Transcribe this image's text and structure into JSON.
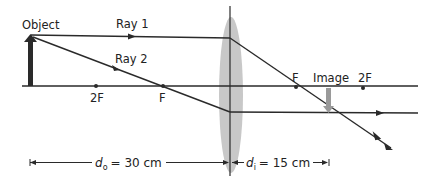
{
  "diagram": {
    "labels": {
      "object": "Object",
      "image": "Image",
      "ray1": "Ray 1",
      "ray2": "Ray 2",
      "left_2f": "2F",
      "left_f": "F",
      "right_f": "F",
      "right_2f": "2F"
    },
    "distances": {
      "do_symbol": "d",
      "do_sub": "o",
      "do_value": "= 30 cm",
      "di_symbol": "d",
      "di_sub": "i",
      "di_value": "= 15 cm"
    },
    "colors": {
      "lines": "#2a2a2a",
      "lens": "#c8c8c8",
      "object_arrow": "#2a2a2a",
      "image_arrow": "#9a9a9a"
    }
  }
}
